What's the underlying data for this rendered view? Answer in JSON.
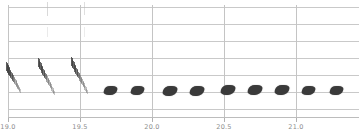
{
  "chart_data": {
    "type": "heatmap",
    "title": "",
    "xlabel": "",
    "ylabel": "",
    "xlim": [
      18.94,
      21.44
    ],
    "ylim": [
      0,
      8
    ],
    "grid": true,
    "legend": "none",
    "x_ticks": [
      {
        "value": "19.0",
        "px": 8
      },
      {
        "value": "19.5",
        "px": 80
      },
      {
        "value": "20.0",
        "px": 152
      },
      {
        "value": "20.5",
        "px": 224
      },
      {
        "value": "21.0",
        "px": 296
      }
    ],
    "y_gridlines_px": [
      7,
      24,
      41,
      58,
      75,
      92,
      109
    ],
    "annotations": [
      "descending frequency-modulated chirps at 19.0-19.6 s",
      "series of short broadband pulses from 19.7 s onward",
      "faint high-frequency harmonic ticks near the top of the plot"
    ],
    "events": {
      "chirps": [
        {
          "x": 6,
          "y": 62,
          "w": 16,
          "h": 36
        },
        {
          "x": 38,
          "y": 58,
          "w": 18,
          "h": 42
        },
        {
          "x": 71,
          "y": 57,
          "w": 18,
          "h": 42
        }
      ],
      "pulses": [
        {
          "x": 104,
          "y": 86,
          "w": 13,
          "h": 9
        },
        {
          "x": 131,
          "y": 86,
          "w": 13,
          "h": 9
        },
        {
          "x": 163,
          "y": 86,
          "w": 14,
          "h": 10
        },
        {
          "x": 190,
          "y": 86,
          "w": 14,
          "h": 10
        },
        {
          "x": 221,
          "y": 85,
          "w": 14,
          "h": 10
        },
        {
          "x": 248,
          "y": 85,
          "w": 14,
          "h": 10
        },
        {
          "x": 275,
          "y": 85,
          "w": 14,
          "h": 10
        },
        {
          "x": 302,
          "y": 86,
          "w": 13,
          "h": 9
        },
        {
          "x": 330,
          "y": 86,
          "w": 13,
          "h": 9
        }
      ],
      "high_freq_ticks": [
        {
          "x": 47,
          "y": 2,
          "h": 14,
          "o": 0.55
        },
        {
          "x": 47,
          "y": 27,
          "h": 10,
          "o": 0.3
        },
        {
          "x": 84,
          "y": 2,
          "h": 13,
          "o": 0.45
        },
        {
          "x": 84,
          "y": 27,
          "h": 10,
          "o": 0.28
        }
      ]
    }
  }
}
